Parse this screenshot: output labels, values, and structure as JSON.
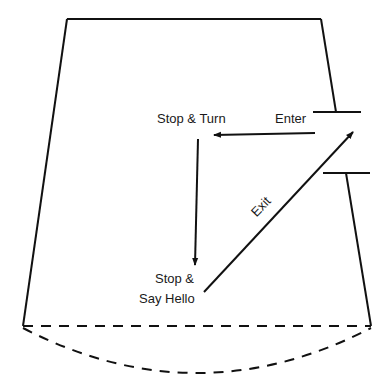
{
  "diagram": {
    "type": "room-floor-plan-path",
    "labels": {
      "stop_turn": "Stop & Turn",
      "enter": "Enter",
      "stop_line1": "Stop &",
      "stop_line2": "Say Hello",
      "exit": "Exit"
    },
    "colors": {
      "line": "#111111",
      "background": "#ffffff"
    }
  }
}
